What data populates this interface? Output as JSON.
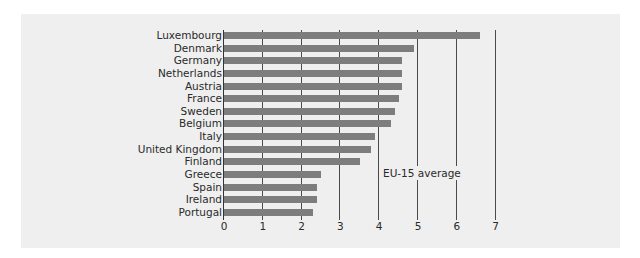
{
  "chart_data": {
    "type": "bar",
    "orientation": "horizontal",
    "title": "",
    "xlabel": "",
    "ylabel": "",
    "categories": [
      "Luxembourg",
      "Denmark",
      "Germany",
      "Netherlands",
      "Austria",
      "France",
      "Sweden",
      "Belgium",
      "Italy",
      "United Kingdom",
      "Finland",
      "Greece",
      "Spain",
      "Ireland",
      "Portugal"
    ],
    "values": [
      6.6,
      4.9,
      4.6,
      4.6,
      4.6,
      4.5,
      4.4,
      4.3,
      3.9,
      3.8,
      3.5,
      2.5,
      2.4,
      2.4,
      2.3
    ],
    "xlim": [
      0,
      7
    ],
    "xticks": [
      "0",
      "1",
      "2",
      "3",
      "4",
      "5",
      "6",
      "7"
    ],
    "grid": true,
    "reference_line": {
      "value": 5,
      "label": "EU-15 average"
    },
    "bar_color": "#7d7d7d",
    "background_color": "#efefef"
  }
}
